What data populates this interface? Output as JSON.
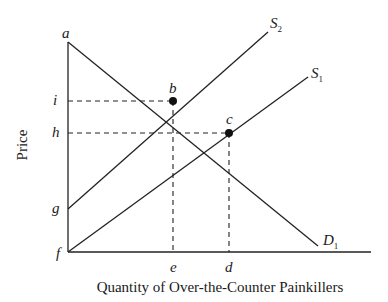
{
  "diagram": {
    "title": "",
    "axes": {
      "x_label": "Quantity of Over-the-Counter Painkillers",
      "y_label": "Price"
    },
    "curves": [
      {
        "id": "S2",
        "label_main": "S",
        "label_sub": "2",
        "type": "supply"
      },
      {
        "id": "S1",
        "label_main": "S",
        "label_sub": "1",
        "type": "supply"
      },
      {
        "id": "D1",
        "label_main": "D",
        "label_sub": "1",
        "type": "demand"
      }
    ],
    "points": {
      "a": "a",
      "b": "b",
      "c": "c",
      "d": "d",
      "e": "e",
      "f": "f",
      "g": "g",
      "h": "h",
      "i": "i"
    },
    "equilibria": [
      {
        "point": "b",
        "curves": [
          "S2",
          "D1"
        ],
        "price_label": "i",
        "quantity_label": "e"
      },
      {
        "point": "c",
        "curves": [
          "S1",
          "D1"
        ],
        "price_label": "h",
        "quantity_label": "d"
      }
    ],
    "y_axis_labels_top_to_bottom": [
      "a",
      "i",
      "h",
      "g",
      "f"
    ],
    "x_axis_labels_left_to_right": [
      "e",
      "d"
    ]
  }
}
